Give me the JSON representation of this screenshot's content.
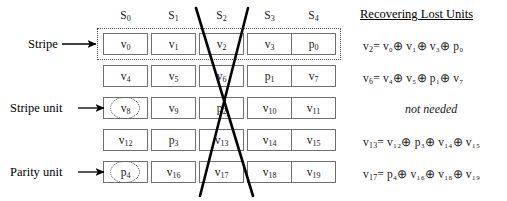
{
  "figure": {
    "columns": [
      {
        "label": "S",
        "sub": "0"
      },
      {
        "label": "S",
        "sub": "1"
      },
      {
        "label": "S",
        "sub": "2"
      },
      {
        "label": "S",
        "sub": "3"
      },
      {
        "label": "S",
        "sub": "4"
      }
    ],
    "grid": [
      [
        {
          "base": "v",
          "sub": "0"
        },
        {
          "base": "v",
          "sub": "1"
        },
        {
          "base": "v",
          "sub": "2"
        },
        {
          "base": "v",
          "sub": "3"
        },
        {
          "base": "p",
          "sub": "0"
        }
      ],
      [
        {
          "base": "v",
          "sub": "4"
        },
        {
          "base": "v",
          "sub": "5"
        },
        {
          "base": "v",
          "sub": "6"
        },
        {
          "base": "p",
          "sub": "1"
        },
        {
          "base": "v",
          "sub": "7"
        }
      ],
      [
        {
          "base": "v",
          "sub": "8"
        },
        {
          "base": "v",
          "sub": "9"
        },
        {
          "base": "p",
          "sub": "2"
        },
        {
          "base": "v",
          "sub": "10"
        },
        {
          "base": "v",
          "sub": "11"
        }
      ],
      [
        {
          "base": "v",
          "sub": "12"
        },
        {
          "base": "p",
          "sub": "3"
        },
        {
          "base": "v",
          "sub": "13"
        },
        {
          "base": "v",
          "sub": "14"
        },
        {
          "base": "v",
          "sub": "15"
        }
      ],
      [
        {
          "base": "p",
          "sub": "4"
        },
        {
          "base": "v",
          "sub": "16"
        },
        {
          "base": "v",
          "sub": "17"
        },
        {
          "base": "v",
          "sub": "18"
        },
        {
          "base": "v",
          "sub": "19"
        }
      ]
    ],
    "annotations": {
      "stripe_label": "Stripe",
      "stripe_unit_label": "Stripe unit",
      "parity_unit_label": "Parity unit"
    },
    "panel": {
      "title": "Recovering Lost Units",
      "equations": [
        {
          "lhs": "v",
          "lhs_sub": "2",
          "rhs": "= v₀⊕ v₁⊕ v₃⊕ p₀"
        },
        {
          "lhs": "v",
          "lhs_sub": "6",
          "rhs": "= v₄⊕ v₅⊕ p₁⊕ v₇"
        },
        {
          "lhs": "",
          "lhs_sub": "",
          "rhs": "not needed"
        },
        {
          "lhs": "v",
          "lhs_sub": "13",
          "rhs": "= v₁₂⊕ p₃⊕ v₁₄⊕ v₁₅"
        },
        {
          "lhs": "v",
          "lhs_sub": "17",
          "rhs": "= p₄⊕ v₁₆⊕ v₁₈⊕ v₁₉"
        }
      ],
      "not_needed_text": "not needed"
    },
    "colors": {
      "cell_border": "#6e6e6e",
      "dotted": "#555555",
      "failure_mark": "#000000",
      "text": "#1a1a1a"
    }
  }
}
